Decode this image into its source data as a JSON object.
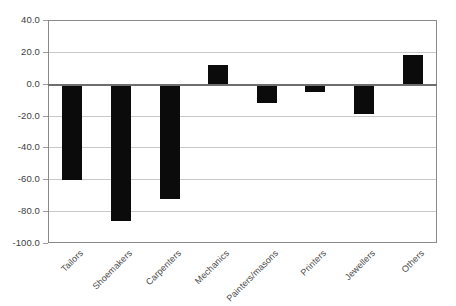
{
  "chart_data": {
    "type": "bar",
    "title": "",
    "subtitle": "",
    "xlabel": "",
    "ylabel": "",
    "categories": [
      "Tailors",
      "Shoemakers",
      "Carpenters",
      "Mechanics",
      "Painters/masons",
      "Printers",
      "Jewellers",
      "Others"
    ],
    "values": [
      -60.0,
      -86.0,
      -72.0,
      12.0,
      -12.0,
      -5.0,
      -19.0,
      18.0
    ],
    "ylim": [
      -100.0,
      40.0
    ],
    "ytick_values": [
      40.0,
      20.0,
      0.0,
      -20.0,
      -40.0,
      -60.0,
      -80.0,
      -100.0
    ],
    "ytick_labels": [
      "40.0",
      "20.0",
      "0.0",
      "-20.0",
      "-40.0",
      "-60.0",
      "-80.0",
      "-100.0"
    ],
    "grid": true,
    "legend": false,
    "legend_position": "none",
    "bar_color": "#0b0b0b",
    "grid_color": "#c8c8c8",
    "axis_color": "#8a8a8a",
    "zero_line_color": "#6e6e6e",
    "tick_label_color": "#4a4a4a",
    "xtick_rotation": -45
  }
}
